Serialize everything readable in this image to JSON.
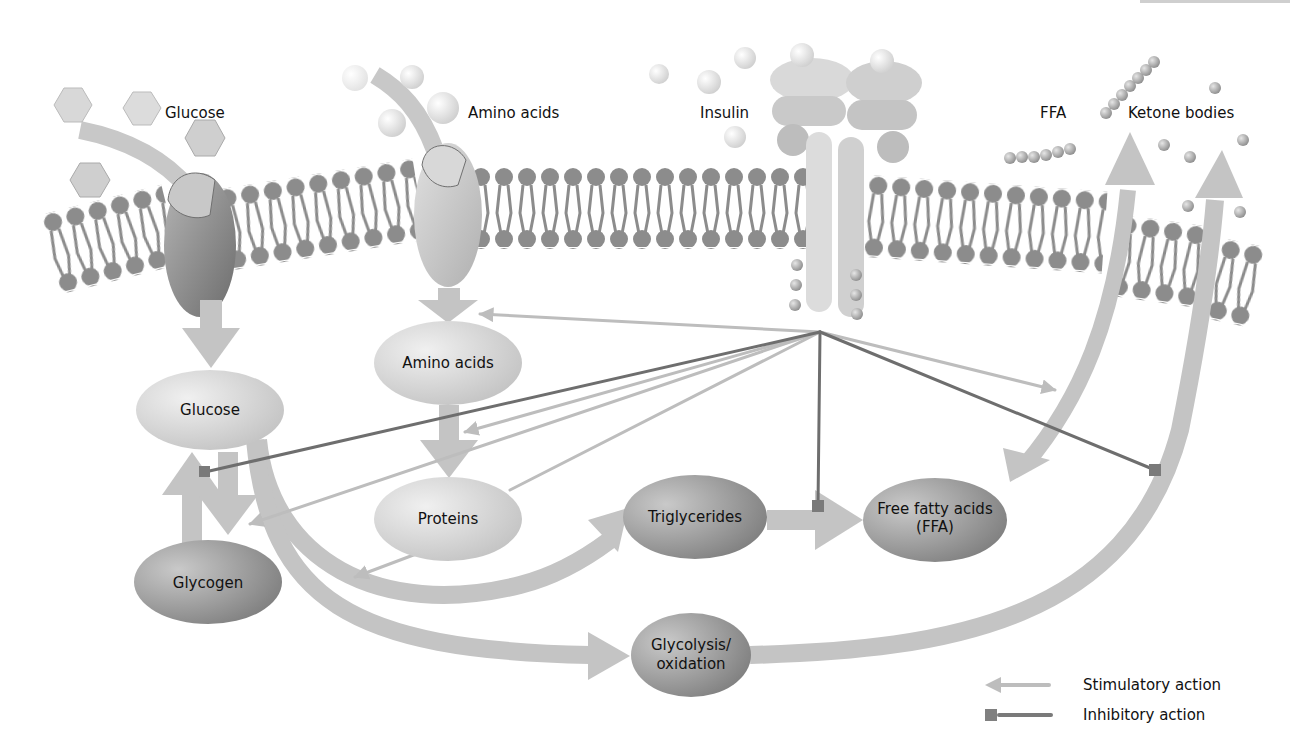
{
  "figure": {
    "type": "insulin metabolic action diagram",
    "cut_off_header_text": "...gy, ...gy ... ..."
  },
  "extracellular_labels": {
    "glucose": "Glucose",
    "amino_acids": "Amino acids",
    "insulin": "Insulin",
    "ffa": "FFA",
    "ketone_bodies": "Ketone bodies"
  },
  "nodes": [
    {
      "id": "glucose",
      "label": "Glucose",
      "cx": 210,
      "cy": 410,
      "rx": 74,
      "ry": 40,
      "shade": "light"
    },
    {
      "id": "glycogen",
      "label": "Glycogen",
      "cx": 208,
      "cy": 582,
      "rx": 74,
      "ry": 42,
      "shade": "dark"
    },
    {
      "id": "amino_acids",
      "label": "Amino acids",
      "cx": 448,
      "cy": 363,
      "rx": 74,
      "ry": 42,
      "shade": "light"
    },
    {
      "id": "proteins",
      "label": "Proteins",
      "cx": 448,
      "cy": 519,
      "rx": 74,
      "ry": 42,
      "shade": "light"
    },
    {
      "id": "triglycerides",
      "label": "Triglycerides",
      "cx": 695,
      "cy": 517,
      "rx": 72,
      "ry": 42,
      "shade": "dark"
    },
    {
      "id": "ffa",
      "label_line1": "Free fatty acids",
      "label_line2": "(FFA)",
      "cx": 935,
      "cy": 520,
      "rx": 72,
      "ry": 42,
      "shade": "dark"
    },
    {
      "id": "glycolysis",
      "label_line1": "Glycolysis/",
      "label_line2": "oxidation",
      "cx": 691,
      "cy": 655,
      "rx": 60,
      "ry": 42,
      "shade": "dark"
    }
  ],
  "insulin_signal_hub": {
    "x": 820,
    "y": 332
  },
  "actions": [
    {
      "type": "stimulatory",
      "target": "Amino acids uptake (transporter)",
      "to": [
        478,
        314
      ]
    },
    {
      "type": "inhibitory",
      "target": "Glycogen -> Glucose (glycogenolysis)",
      "to": [
        205,
        470
      ]
    },
    {
      "type": "stimulatory",
      "target": "Amino acids -> Proteins",
      "to": [
        465,
        432
      ]
    },
    {
      "type": "stimulatory",
      "target": "Glucose -> Glycogen",
      "to": [
        248,
        524
      ]
    },
    {
      "type": "stimulatory",
      "target": "Glucose -> Triglycerides",
      "to": [
        350,
        500
      ]
    },
    {
      "type": "inhibitory",
      "target": "Triglycerides -> FFA (lipolysis)",
      "to": [
        818,
        510
      ]
    },
    {
      "type": "inhibitory",
      "target": "FFA -> Ketone bodies",
      "to": [
        1155,
        470
      ]
    },
    {
      "type": "stimulatory",
      "target": "FFA uptake",
      "to": [
        1025,
        392
      ]
    }
  ],
  "legend": {
    "stimulatory": "Stimulatory action",
    "inhibitory": "Inhibitory action"
  },
  "colors": {
    "background": "#ffffff",
    "membrane_lipid": "#8a8a8a",
    "light_node": "#d6d6d6",
    "dark_node": "#8e8e8e",
    "flow_arrow": "#c4c4c4",
    "stimulatory": "#bdbdbd",
    "inhibitory": "#707070",
    "text": "#111111"
  }
}
